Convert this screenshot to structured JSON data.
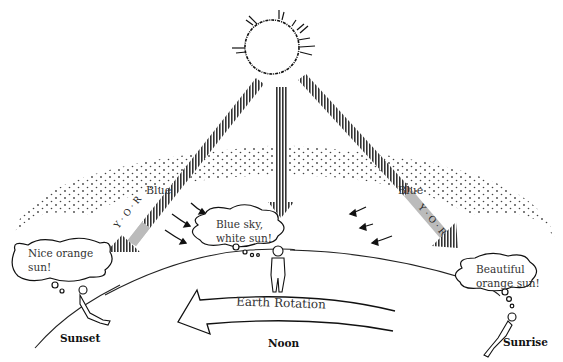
{
  "diagram": {
    "beams": [
      {
        "id": "left",
        "scatter_label": "Blue",
        "remaining_colors": "Y·O·R"
      },
      {
        "id": "center"
      },
      {
        "id": "right",
        "scatter_label": "Blue",
        "remaining_colors": "Y·O·R"
      }
    ],
    "thoughts": {
      "sunset": [
        "Nice orange",
        "sun!"
      ],
      "noon": [
        "Blue sky,",
        "white sun!"
      ],
      "sunrise": [
        "Beautiful",
        "orange sun!"
      ]
    },
    "rotation_label": "Earth Rotation",
    "captions": {
      "sunset": "Sunset",
      "noon": "Noon",
      "sunrise": "Sunrise"
    },
    "colors": {
      "ink": "#222222",
      "beam_fill": "#bbbbbb",
      "beam_dark": "#444444",
      "background": "#ffffff"
    }
  }
}
